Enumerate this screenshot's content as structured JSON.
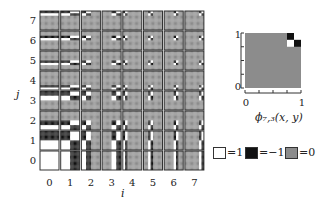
{
  "grid": {
    "size": 8,
    "x_axis_label": "i",
    "y_axis_label": "j",
    "col_labels": [
      "0",
      "1",
      "2",
      "3",
      "4",
      "5",
      "6",
      "7"
    ],
    "row_labels": [
      "0",
      "1",
      "2",
      "3",
      "4",
      "5",
      "6",
      "7"
    ],
    "basis": "haar_2d_product",
    "colors": {
      "plus_one": "#ffffff",
      "minus_one": "#111111",
      "zero": "#8c8c8c",
      "border": "#333333"
    }
  },
  "inset": {
    "caption": "ϕ₇,₃(x, y)",
    "i": 7,
    "j": 3,
    "x_ticks": [
      "0",
      "1"
    ],
    "y_ticks": [
      "0",
      "1"
    ],
    "x_range": [
      0,
      1
    ],
    "y_range": [
      0,
      1
    ]
  },
  "legend": [
    {
      "value_label": "=1",
      "color": "#ffffff"
    },
    {
      "value_label": "=−1",
      "color": "#111111"
    },
    {
      "value_label": "=0",
      "color": "#8c8c8c"
    }
  ]
}
